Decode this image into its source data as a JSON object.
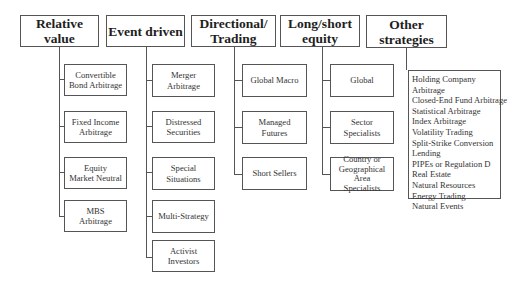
{
  "diagram": {
    "categories": [
      {
        "label": "Relative value",
        "children": [
          "Convertible Bond Arbitrage",
          "Fixed Income Arbitrage",
          "Equity Market Neutral",
          "MBS Arbitrage"
        ]
      },
      {
        "label": "Event driven",
        "children": [
          "Merger Arbitrage",
          "Distressed Securities",
          "Special Situations",
          "Multi-Strategy",
          "Activist Investors"
        ]
      },
      {
        "label": "Directional/ Trading",
        "children": [
          "Global Macro",
          "Managed Futures",
          "Short Sellers"
        ]
      },
      {
        "label": "Long/short equity",
        "children": [
          "Global",
          "Sector Specialists",
          "Country or Geographical Area Specialists"
        ]
      },
      {
        "label": "Other strategies",
        "list_items": [
          "Holding Company",
          "Arbitrage",
          "Closed-End Fund Arbitrage",
          "Statistical Arbitrage",
          "Index Arbitrage",
          "Volatility Trading",
          "Split-Strike Conversion",
          "Lending",
          "PIPEs or Regulation D",
          "Real Estate",
          "Natural Resources",
          "Energy Trading",
          "Natural Events"
        ]
      }
    ],
    "text_lines": {
      "rv_top": "Relative value",
      "ed_top": "Event driven",
      "dt_top_1": "Directional/",
      "dt_top_2": "Trading",
      "ls_top_1": "Long/short",
      "ls_top_2": "equity",
      "os_top": "Other strategies",
      "rv_c1_1": "Convertible",
      "rv_c1_2": "Bond Arbitrage",
      "rv_c2_1": "Fixed Income",
      "rv_c2_2": "Arbitrage",
      "rv_c3_1": "Equity",
      "rv_c3_2": "Market Neutral",
      "rv_c4_1": "MBS",
      "rv_c4_2": "Arbitrage",
      "ed_c1_1": "Merger",
      "ed_c1_2": "Arbitrage",
      "ed_c2_1": "Distressed",
      "ed_c2_2": "Securities",
      "ed_c3_1": "Special",
      "ed_c3_2": "Situations",
      "ed_c4": "Multi-Strategy",
      "ed_c5": "Activist Investors",
      "dt_c1": "Global Macro",
      "dt_c2": "Managed Futures",
      "dt_c3": "Short Sellers",
      "ls_c1": "Global",
      "ls_c2": "Sector Specialists",
      "ls_c3_1": "Country or",
      "ls_c3_2": "Geographical Area",
      "ls_c3_3": "Specialists"
    },
    "colors": {
      "line": "#555555",
      "text": "#2a2a2a",
      "background": "#ffffff"
    }
  }
}
